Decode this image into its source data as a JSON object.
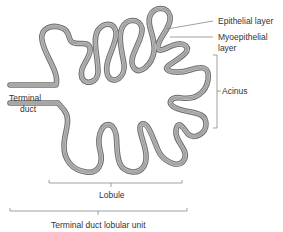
{
  "diagram": {
    "labels": {
      "epithelial": "Epithelial layer",
      "myoepithelial_1": "Myoepithelial",
      "myoepithelial_2": "layer",
      "acinus": "Acinus",
      "terminal_1": "Terminal",
      "terminal_2": "duct",
      "lobule": "Lobule",
      "tdlu": "Terminal duct lobular unit"
    },
    "colors": {
      "outer_stroke": "#6e6e6e",
      "mid_stroke": "#b4b4b4",
      "inner_stroke": "#8a8a8a",
      "leader_line": "#7a7a7a",
      "text": "#333333"
    }
  }
}
